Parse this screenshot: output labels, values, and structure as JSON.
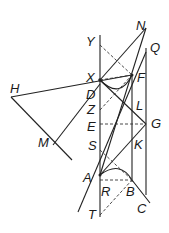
{
  "diagram": {
    "type": "geometric-construction",
    "points": {
      "N": [
        146,
        28
      ],
      "Y": [
        100,
        40
      ],
      "Q": [
        146,
        48
      ],
      "X": [
        100,
        80
      ],
      "F": [
        132,
        75
      ],
      "H": [
        11,
        97
      ],
      "D": [
        100,
        84
      ],
      "Z": [
        100,
        108
      ],
      "L": [
        132,
        105
      ],
      "E": [
        100,
        124
      ],
      "G": [
        146,
        124
      ],
      "S": [
        100,
        150
      ],
      "K": [
        132,
        150
      ],
      "M": [
        53,
        145
      ],
      "A": [
        100,
        175
      ],
      "R": [
        100,
        180
      ],
      "B": [
        132,
        180
      ],
      "C": [
        150,
        200
      ],
      "T": [
        100,
        215
      ]
    },
    "labels": [
      {
        "text": "N",
        "x": 136,
        "y": 30
      },
      {
        "text": "Y",
        "x": 86,
        "y": 46
      },
      {
        "text": "Q",
        "x": 150,
        "y": 52
      },
      {
        "text": "X",
        "x": 86,
        "y": 82
      },
      {
        "text": "F",
        "x": 137,
        "y": 82
      },
      {
        "text": "H",
        "x": 10,
        "y": 93
      },
      {
        "text": "D",
        "x": 86,
        "y": 99
      },
      {
        "text": "Z",
        "x": 87,
        "y": 114
      },
      {
        "text": "L",
        "x": 136,
        "y": 110
      },
      {
        "text": "E",
        "x": 87,
        "y": 131
      },
      {
        "text": "G",
        "x": 151,
        "y": 128
      },
      {
        "text": "M",
        "x": 38,
        "y": 147
      },
      {
        "text": "S",
        "x": 88,
        "y": 150
      },
      {
        "text": "K",
        "x": 134,
        "y": 149
      },
      {
        "text": "A",
        "x": 83,
        "y": 182
      },
      {
        "text": "R",
        "x": 101,
        "y": 196
      },
      {
        "text": "B",
        "x": 126,
        "y": 196
      },
      {
        "text": "C",
        "x": 137,
        "y": 213
      },
      {
        "text": "T",
        "x": 88,
        "y": 219
      }
    ]
  }
}
